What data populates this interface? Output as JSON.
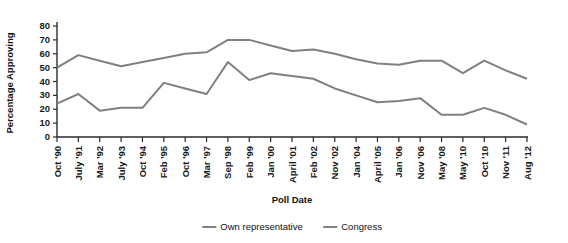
{
  "chart_data": {
    "type": "line",
    "title": "",
    "xlabel": "Poll Date",
    "ylabel": "Percentage Approving",
    "ylim": [
      0,
      80
    ],
    "ytick_step": 10,
    "yticks": [
      0,
      10,
      20,
      30,
      40,
      50,
      60,
      70,
      80
    ],
    "grid": false,
    "legend_position": "bottom-center",
    "categories": [
      "Oct '90",
      "July '91",
      "Mar '92",
      "July '93",
      "Oct '94",
      "Feb '95",
      "Oct '96",
      "Mar '97",
      "Sep '98",
      "Feb '99",
      "Jan '00",
      "April '01",
      "Feb '02",
      "Nov '02",
      "Jan '04",
      "April '05",
      "Jan '06",
      "Nov '06",
      "May '08",
      "May '10",
      "Oct '10",
      "Nov '11",
      "Aug '12"
    ],
    "series": [
      {
        "name": "Own representative",
        "color": "#808080",
        "values": [
          50,
          59,
          55,
          51,
          54,
          57,
          60,
          61,
          70,
          70,
          66,
          62,
          63,
          60,
          56,
          53,
          52,
          55,
          55,
          46,
          55,
          48,
          42
        ]
      },
      {
        "name": "Congress",
        "color": "#808080",
        "values": [
          24,
          31,
          19,
          21,
          21,
          39,
          35,
          31,
          54,
          41,
          46,
          44,
          42,
          35,
          30,
          25,
          26,
          28,
          16,
          16,
          21,
          16,
          9
        ]
      }
    ]
  },
  "legend": {
    "items": [
      {
        "label": "Own representative",
        "color": "#808080"
      },
      {
        "label": "Congress",
        "color": "#808080"
      }
    ]
  },
  "axes": {
    "y_title": "Percentage Approving",
    "x_title": "Poll Date"
  }
}
